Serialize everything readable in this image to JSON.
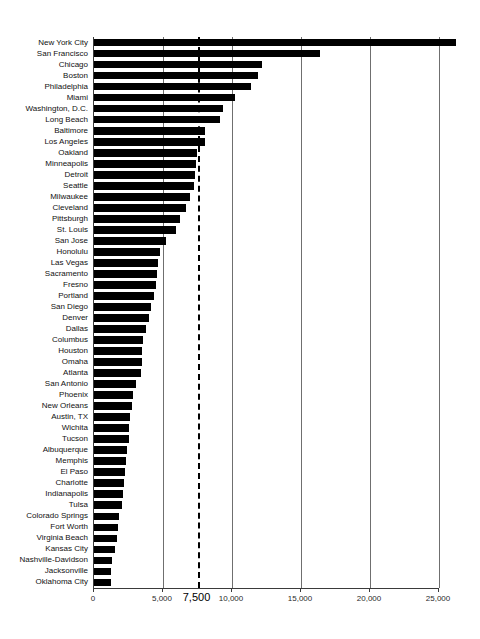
{
  "chart_data": {
    "type": "bar",
    "orientation": "horizontal",
    "title": "",
    "subtitle": "",
    "xlabel": "",
    "ylabel": "",
    "xlim": [
      0,
      26500
    ],
    "grid": true,
    "legend": null,
    "xticks": [
      0,
      5000,
      10000,
      15000,
      20000,
      25000
    ],
    "xticklabels": [
      "0",
      "5,000",
      "10,000",
      "15,000",
      "20,000",
      "25,000"
    ],
    "emphasis_tick": {
      "value": 7500,
      "label": "7,500",
      "style": "dashed-vertical-line"
    },
    "bar_color": "#000000",
    "categories": [
      "New York City",
      "San Francisco",
      "Chicago",
      "Boston",
      "Philadelphia",
      "Miami",
      "Washington, D.C.",
      "Long Beach",
      "Baltimore",
      "Los Angeles",
      "Oakland",
      "Minneapolis",
      "Detroit",
      "Seattle",
      "Milwaukee",
      "Cleveland",
      "Pittsburgh",
      "St. Louis",
      "San Jose",
      "Honolulu",
      "Las Vegas",
      "Sacramento",
      "Fresno",
      "Portland",
      "San Diego",
      "Denver",
      "Dallas",
      "Columbus",
      "Houston",
      "Omaha",
      "Atlanta",
      "San Antonio",
      "Phoenix",
      "New Orleans",
      "Austin, TX",
      "Wichita",
      "Tucson",
      "Albuquerque",
      "Memphis",
      "El Paso",
      "Charlotte",
      "Indianapolis",
      "Tulsa",
      "Colorado Springs",
      "Fort Worth",
      "Virginia Beach",
      "Kansas City",
      "Nashville-Davidson",
      "Jacksonville",
      "Oklahoma City"
    ],
    "values": [
      26250,
      16400,
      12200,
      11900,
      11400,
      10200,
      9350,
      9150,
      8050,
      8050,
      7450,
      7400,
      7300,
      7250,
      6950,
      6700,
      6250,
      5950,
      5200,
      4750,
      4650,
      4600,
      4500,
      4350,
      4150,
      3950,
      3800,
      3550,
      3500,
      3450,
      3400,
      3050,
      2800,
      2750,
      2600,
      2550,
      2500,
      2400,
      2350,
      2250,
      2200,
      2100,
      2000,
      1800,
      1750,
      1700,
      1500,
      1300,
      1250,
      1200
    ]
  }
}
